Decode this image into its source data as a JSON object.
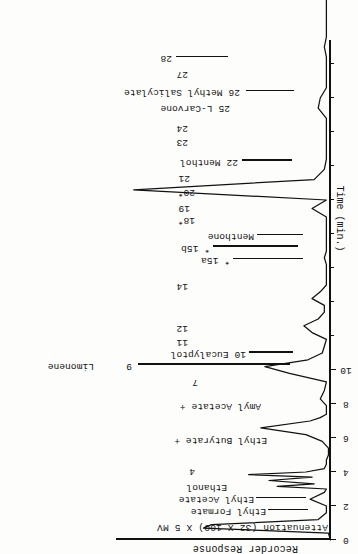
{
  "figure": {
    "kind": "gas-chromatogram",
    "orientation_note": "printed-upside-down",
    "response_axis_title": "Recorder Response",
    "attenuation_title": "Attenuation (32 X 100) X 5 MV",
    "time_axis_title": "Time (min.)"
  },
  "chart_data": {
    "type": "line",
    "title": "Recorder Response",
    "subtitle": "Attenuation (32 X 100) X 5 MV",
    "xlabel": "Time (min.)",
    "ylabel": "Recorder Response",
    "xlim": [
      0,
      58
    ],
    "ylim": [
      0,
      100
    ],
    "grid": false,
    "legend": "none",
    "axis_ticks_labeled": [
      "0",
      "2",
      "4",
      "6",
      "8",
      "10"
    ],
    "axis_tick_values": [
      0,
      2,
      4,
      6,
      8,
      10
    ],
    "minor_tick_values": [
      12,
      14,
      16,
      18,
      20,
      22,
      24,
      26,
      28,
      30,
      32,
      34,
      36,
      38,
      40,
      42,
      44,
      46,
      48,
      50,
      52,
      54,
      56
    ],
    "series": [
      {
        "name": "FID signal",
        "x": [
          0.0,
          0.4,
          0.7,
          0.9,
          1.2,
          1.6,
          2.0,
          2.4,
          2.8,
          3.0,
          3.15,
          3.3,
          3.5,
          3.7,
          3.85,
          4.0,
          4.2,
          4.45,
          4.7,
          5.0,
          5.4,
          5.8,
          6.2,
          6.6,
          7.0,
          7.2,
          7.4,
          7.6,
          7.9,
          8.3,
          8.8,
          9.3,
          9.8,
          10.2,
          10.6,
          11.0,
          11.4,
          11.8,
          12.2,
          12.6,
          13.0,
          13.4,
          13.8,
          14.2,
          14.6,
          15.0,
          15.4,
          15.8,
          16.2,
          16.6,
          17.0,
          17.4,
          17.8,
          18.2,
          18.6,
          19.0,
          19.5,
          20.0,
          20.6,
          21.2,
          21.8,
          22.4,
          23.0,
          23.6,
          24.2,
          24.8,
          25.4,
          26.0,
          26.6,
          27.2,
          27.8,
          28.4,
          29.0,
          29.6,
          30.2,
          30.8,
          31.4,
          32.0,
          32.6,
          33.2,
          33.8,
          34.4,
          35.0,
          35.6,
          36.2,
          36.8,
          37.4,
          38.0,
          38.6,
          39.2,
          39.8,
          40.4,
          41.0,
          41.6,
          42.2,
          42.8,
          43.4,
          44.0,
          44.6,
          45.2,
          45.8,
          46.4,
          47.0,
          47.6,
          48.2,
          48.8,
          49.4,
          50.0,
          50.6,
          51.2,
          51.8,
          52.4,
          53.0,
          53.6,
          54.2,
          54.8,
          55.4,
          56.0,
          56.6,
          57.2,
          58.0
        ],
        "y": [
          0,
          1,
          62,
          58,
          6,
          2,
          2,
          10,
          3,
          2,
          26,
          8,
          30,
          9,
          40,
          12,
          3,
          2,
          2,
          1,
          1,
          4,
          12,
          34,
          10,
          5,
          2,
          2,
          2,
          5,
          3,
          2,
          20,
          32,
          11,
          4,
          3,
          2,
          9,
          13,
          6,
          3,
          3,
          9,
          5,
          2,
          2,
          2,
          2,
          3,
          2,
          2,
          2,
          2,
          2,
          2,
          9,
          2,
          96,
          8,
          3,
          2,
          2,
          2,
          2,
          2,
          6,
          5,
          2,
          2,
          2,
          2,
          3,
          2,
          2,
          2,
          2,
          2,
          12,
          8,
          2,
          2,
          2,
          2,
          2,
          2,
          2,
          2,
          2,
          2,
          42,
          40,
          2,
          2,
          16,
          8,
          13,
          6,
          2,
          2,
          2,
          30,
          3,
          2,
          2,
          12,
          4,
          2,
          2,
          2,
          2,
          18,
          5,
          2,
          2,
          2,
          24,
          3,
          2,
          2,
          2
        ]
      }
    ],
    "peaks": [
      {
        "id": "4",
        "label": "4"
      },
      {
        "id": "7",
        "label": "7"
      },
      {
        "id": "9",
        "label": "9",
        "compound": "Limonene"
      },
      {
        "id": "10",
        "label": "10",
        "compound": "Eucalyptol"
      },
      {
        "id": "11",
        "label": "11"
      },
      {
        "id": "12",
        "label": "12"
      },
      {
        "id": "14",
        "label": "14"
      },
      {
        "id": "15a",
        "label": "* 15a"
      },
      {
        "id": "15b",
        "label": "* 15b",
        "compound": "Menthone"
      },
      {
        "id": "18",
        "label": "18*"
      },
      {
        "id": "19",
        "label": "19"
      },
      {
        "id": "20",
        "label": "20*"
      },
      {
        "id": "21",
        "label": "21"
      },
      {
        "id": "22",
        "label": "22",
        "compound": "Menthol"
      },
      {
        "id": "23",
        "label": "23"
      },
      {
        "id": "24",
        "label": "24"
      },
      {
        "id": "25",
        "label": "25",
        "compound": "L-Carvone"
      },
      {
        "id": "26",
        "label": "26",
        "compound": "Methyl Salicylate"
      },
      {
        "id": "27",
        "label": "27"
      },
      {
        "id": "28",
        "label": "28"
      }
    ],
    "compound_annotations": [
      "Ethyl Formate",
      "Ethyl Acetate",
      "Ethanol",
      "Ethyl Butyrate +",
      "Amyl Acetate +",
      "Limonene",
      "Eucalyptol",
      "Menthone",
      "Menthol",
      "L-Carvone",
      "Methyl Salicylate"
    ]
  },
  "annotations": {
    "ethyl_formate": "Ethyl Formate",
    "ethyl_acetate": "Ethyl Acetate",
    "ethanol": "Ethanol",
    "n4": "4",
    "ethyl_butyrate": "Ethyl Butyrate +",
    "amyl_acetate": "Amyl Acetate +",
    "n7": "7",
    "n9": "9",
    "limonene": "Limonene",
    "n10_eucalyptol": "10  Eucalyptol",
    "n11": "11",
    "n12": "12",
    "n14": "14",
    "n15a": "* 15a",
    "n15b": "* 15b",
    "menthone": "Menthone",
    "n18": "18*",
    "n19": "19",
    "n20": "20*",
    "n21": "21",
    "n22_menthol": "22   Menthol",
    "n23": "23",
    "n24": "24",
    "n25_carvone": "25  L-Carvone",
    "n26_methyl_salicylate": "26   Methyl Salicylate",
    "n27": "27",
    "n28": "28"
  },
  "axis": {
    "labels": [
      "0",
      "2",
      "4",
      "6",
      "8",
      "10"
    ]
  },
  "colors": {
    "ink": "#111111",
    "paper": "#fdfdfc"
  }
}
